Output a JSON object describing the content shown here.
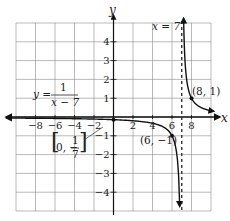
{
  "chart_data": {
    "type": "line",
    "title": "",
    "function": "y = 1/(x - 7)",
    "xlabel": "x",
    "ylabel": "y",
    "xlim": [
      -10,
      10
    ],
    "ylim": [
      -5,
      5
    ],
    "grid": true,
    "x_ticks": [
      -8,
      -6,
      -4,
      -2,
      2,
      4,
      6,
      8
    ],
    "y_ticks": [
      -4,
      -3,
      -2,
      -1,
      1,
      2,
      3,
      4
    ],
    "x_tick_labels": [
      "−8",
      "−6",
      "−4",
      "−2",
      "2",
      "4",
      "6",
      "8"
    ],
    "y_tick_labels": [
      "−4",
      "−3",
      "−2",
      "−1",
      "1",
      "2",
      "3",
      "4"
    ],
    "asymptotes": [
      {
        "type": "vertical",
        "x": 7,
        "label": "x = 7",
        "style": "dashed"
      },
      {
        "type": "horizontal",
        "y": 0
      }
    ],
    "points": [
      {
        "x": 0,
        "y": -0.142857,
        "label": "(0, −1/7)"
      },
      {
        "x": 6,
        "y": -1,
        "label": "(6, −1)"
      },
      {
        "x": 8,
        "y": 1,
        "label": "(8, 1)"
      }
    ],
    "series": [
      {
        "name": "left branch",
        "x": [
          -10,
          -8,
          -6,
          -4,
          -2,
          0,
          2,
          4,
          5,
          6,
          6.5,
          6.8
        ],
        "y": [
          -0.0588,
          -0.0667,
          -0.0769,
          -0.0909,
          -0.1111,
          -0.1429,
          -0.2,
          -0.3333,
          -0.5,
          -1,
          -2,
          -5
        ]
      },
      {
        "name": "right branch",
        "x": [
          7.2,
          7.5,
          8,
          9,
          10
        ],
        "y": [
          5,
          2,
          1,
          0.5,
          0.3333
        ]
      }
    ],
    "annotations": {
      "equation": {
        "lhs": "y =",
        "numerator": "1",
        "denominator": "x − 7"
      },
      "asymptote_label": "x = 7",
      "point_labels": {
        "y_intercept": {
          "open": "(0, −",
          "num": "1",
          "den": "7",
          "close": ")"
        },
        "p6": "(6, −1)",
        "p8": "(8, 1)"
      }
    },
    "colors": {
      "grid": "#8a8a8a",
      "axis": "#111111",
      "curve": "#111111",
      "asymptote": "#333333"
    }
  }
}
